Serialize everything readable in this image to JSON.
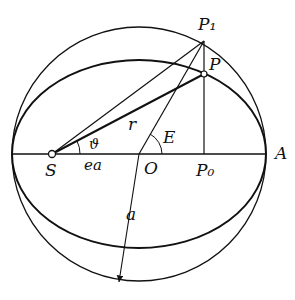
{
  "diagram": {
    "type": "kepler-eccentric-anomaly",
    "labels": {
      "P1": "P₁",
      "P": "P",
      "r": "r",
      "theta": "ϑ",
      "E": "E",
      "S": "S",
      "ea": "ea",
      "O": "O",
      "P0": "P₀",
      "A": "A",
      "a": "a"
    },
    "colors": {
      "ink": "#111111",
      "background": "#ffffff"
    }
  }
}
